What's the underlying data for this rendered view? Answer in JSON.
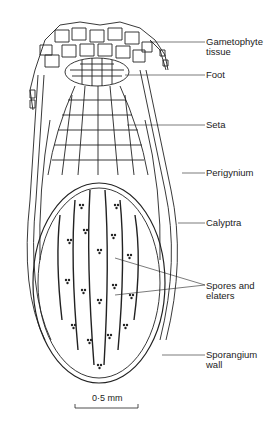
{
  "figure": {
    "labels": [
      {
        "id": "gametophyte",
        "line1": "Gametophyte",
        "line2": "tissue"
      },
      {
        "id": "foot",
        "line1": "Foot",
        "line2": ""
      },
      {
        "id": "seta",
        "line1": "Seta",
        "line2": ""
      },
      {
        "id": "perigynium",
        "line1": "Perigynium",
        "line2": ""
      },
      {
        "id": "calyptra",
        "line1": "Calyptra",
        "line2": ""
      },
      {
        "id": "spores",
        "line1": "Spores and",
        "line2": "elaters"
      },
      {
        "id": "sporangium",
        "line1": "Sporangium",
        "line2": "wall"
      }
    ],
    "scale_bar": {
      "label": "0·5 mm"
    },
    "colors": {
      "ink": "#222222",
      "background": "#ffffff"
    }
  }
}
